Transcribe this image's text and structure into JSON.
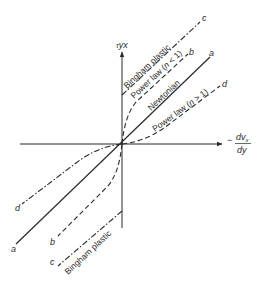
{
  "diagram": {
    "type": "rheology-flow-curves",
    "axes": {
      "y_label": "τyx",
      "y_label_main": "τ",
      "y_label_sub": "yx",
      "x_label_sign": "−",
      "x_label_num": "dvx",
      "x_label_num_main": "dv",
      "x_label_num_sub": "x",
      "x_label_den": "dy"
    },
    "curves": [
      {
        "id": "a",
        "name": "Newtonian",
        "style": "solid",
        "end_letter": "a"
      },
      {
        "id": "b",
        "name": "Power law (n < 1)",
        "style": "dashed",
        "end_letter": "b"
      },
      {
        "id": "c",
        "name": "Bingham plastic",
        "style": "dash-dot",
        "end_letter": "c"
      },
      {
        "id": "d",
        "name": "Power law (n > 1)",
        "style": "dash-dot",
        "end_letter": "d"
      }
    ],
    "labels": {
      "bingham_upper": "Bingham plastic",
      "power_law_lt1": "Power law (",
      "power_law_lt1_n": "n",
      "power_law_lt1_tail": " < 1)",
      "newtonian": "Newtonian",
      "power_law_gt1": "Power law (",
      "power_law_gt1_n": "n",
      "power_law_gt1_tail": " > 1)",
      "bingham_lower": "Bingham plastic",
      "letter_a": "a",
      "letter_b": "b",
      "letter_c": "c",
      "letter_d": "d"
    },
    "colors": {
      "ink": "#2a2a2a",
      "background": "#ffffff"
    }
  }
}
